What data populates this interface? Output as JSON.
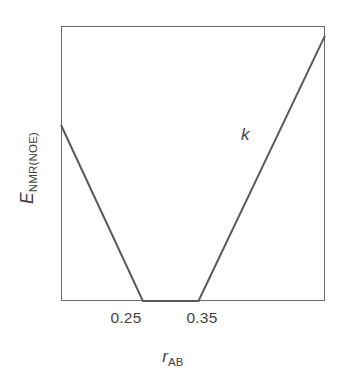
{
  "figure": {
    "background_color": "#ffffff",
    "line_color": "#5a5a5a",
    "frame_color": "#6b6b6b",
    "text_color": "#3f3f3f"
  },
  "axes": {
    "x_title_symbol": "r",
    "x_title_subscript": "AB",
    "y_title_symbol": "E",
    "y_title_subscript": "NMR(NOE)",
    "x_ticks": [
      {
        "label": "0.25",
        "value": 0.25
      },
      {
        "label": "0.35",
        "value": 0.35
      }
    ],
    "y_ticks": []
  },
  "annotations": [
    {
      "text": "k",
      "name": "slope-label-k"
    }
  ],
  "chart_data": {
    "type": "line",
    "title": "",
    "subtitle": "",
    "xlabel": "r_AB",
    "ylabel": "E_NMR(NOE)",
    "xlim": [
      0.215,
      0.431
    ],
    "ylim": [
      0,
      1
    ],
    "grid": false,
    "legend": null,
    "tick_labels_x": [
      "0.25",
      "0.35"
    ],
    "tick_values_x": [
      0.25,
      0.35
    ],
    "tick_labels_y": [],
    "annotations": [
      {
        "text": "k",
        "description": "force-constant slope label on the rising right branch",
        "x": 0.367,
        "y": 0.64
      }
    ],
    "series": [
      {
        "name": "flat-bottom NOE restraint potential",
        "x": [
          0.215,
          0.282,
          0.3275,
          0.431
        ],
        "y": [
          0.64,
          0.0,
          0.0,
          0.965
        ],
        "color": "#5a5a5a",
        "linewidth": 1.8
      }
    ]
  }
}
